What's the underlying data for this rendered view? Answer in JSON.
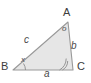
{
  "figure": {
    "type": "geometry-diagram",
    "shape": "triangle",
    "background_color": "#ffffff",
    "fill_color": "#e6e6e6",
    "stroke_color": "#999999",
    "label_color": "#4a4a4a"
  },
  "vertices": [
    {
      "id": "A",
      "label": "A",
      "x": 68,
      "y": 22
    },
    {
      "id": "B",
      "label": "B",
      "x": 13,
      "y": 70
    },
    {
      "id": "C",
      "label": "C",
      "x": 73,
      "y": 70
    }
  ],
  "sides": [
    {
      "id": "a",
      "label": "a",
      "between": "B-C",
      "position": "bottom"
    },
    {
      "id": "b",
      "label": "b",
      "between": "A-C",
      "position": "right"
    },
    {
      "id": "c",
      "label": "c",
      "between": "A-B",
      "position": "upper-left"
    }
  ],
  "angles": [
    {
      "at": "A",
      "label": "o",
      "marker": "none"
    },
    {
      "at": "B",
      "label": "x",
      "marker": "arc"
    },
    {
      "at": "C",
      "label": "",
      "marker": "double-arc"
    }
  ]
}
